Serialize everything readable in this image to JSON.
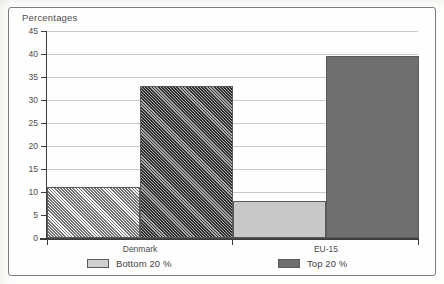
{
  "chart_data": {
    "type": "bar",
    "title": "Percentages",
    "xlabel": "",
    "ylabel": "Percentages",
    "categories": [
      "Denmark",
      "EU-15"
    ],
    "series": [
      {
        "name": "Bottom 20 %",
        "values": [
          11,
          8
        ],
        "color": "#c8c8c8",
        "pattern": "solid"
      },
      {
        "name": "Top 20 %",
        "values": [
          33,
          39.5
        ],
        "color": "#6f6f6f",
        "pattern": "solid"
      }
    ],
    "ylim": [
      0,
      45
    ],
    "ytick_step": 5,
    "ytick_labels": [
      "0",
      "5",
      "10",
      "15",
      "20",
      "25",
      "30",
      "35",
      "40",
      "45"
    ],
    "grid": true,
    "legend_position": "bottom"
  },
  "figure": {
    "title": "Percentages",
    "categories": [
      "Denmark",
      "EU-15"
    ],
    "legend": [
      {
        "label": "Bottom 20 %",
        "swatch": "light"
      },
      {
        "label": "Top 20 %",
        "swatch": "dark"
      }
    ]
  },
  "colors": {
    "light_bar": "#c8c8c8",
    "dark_bar": "#6f6f6f",
    "gridline": "#c9c9c9",
    "axis": "#3d3d3d",
    "frame": "#7c7c7c",
    "text": "#4a4a4a"
  }
}
